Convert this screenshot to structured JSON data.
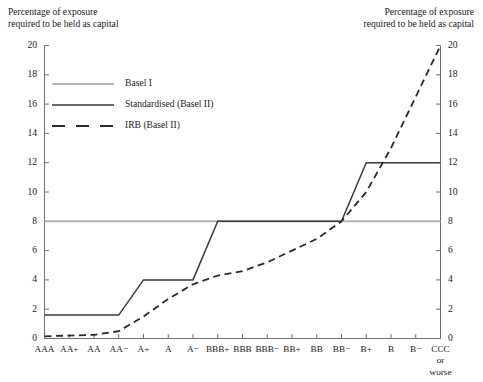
{
  "chart_data": {
    "type": "line",
    "title": "",
    "axis_title_left": "Percentage of exposure\nrequired to be held as capital",
    "axis_title_right": "Percentage of exposure\nrequired to be held as capital",
    "xlabel": "",
    "ylabel": "",
    "ylim": [
      0,
      20
    ],
    "yticks": [
      0,
      2,
      4,
      6,
      8,
      10,
      12,
      14,
      16,
      18,
      20
    ],
    "ytick_labels_left": [
      "0",
      "2",
      "4",
      "6",
      "8",
      "10",
      "12",
      "14",
      "16",
      "18",
      "20"
    ],
    "ytick_labels_right": [
      "0",
      "2",
      "4",
      "6",
      "8",
      "10",
      "12",
      "14",
      "16",
      "18",
      "20"
    ],
    "grid": false,
    "legend_position": "upper-left-inside",
    "categories": [
      "AAA",
      "AA+",
      "AA",
      "AA−",
      "A+",
      "A",
      "A−",
      "BBB+",
      "BBB",
      "BBB−",
      "BB+",
      "BB",
      "BB−",
      "B+",
      "B",
      "B−",
      "CCC\nor\nworse"
    ],
    "category_labels": [
      "AAA",
      "AA+",
      "AA",
      "AA−",
      "A+",
      "A",
      "A−",
      "BBB+",
      "BBB",
      "BBB−",
      "BB+",
      "BB",
      "BB−",
      "B+",
      "B",
      "B−",
      "CCC or worse"
    ],
    "series": [
      {
        "name": "Basel I",
        "style": "solid",
        "color": "#b6b6b6",
        "width": 2.0,
        "values": [
          8,
          8,
          8,
          8,
          8,
          8,
          8,
          8,
          8,
          8,
          8,
          8,
          8,
          8,
          8,
          8,
          8
        ]
      },
      {
        "name": "Standardised (Basel II)",
        "style": "solid",
        "color": "#3a3a3a",
        "width": 1.5,
        "values": [
          1.6,
          1.6,
          1.6,
          1.6,
          4,
          4,
          4,
          8,
          8,
          8,
          8,
          8,
          8,
          12,
          12,
          12,
          12
        ]
      },
      {
        "name": "IRB (Basel II)",
        "style": "dashed",
        "color": "#2a2a2a",
        "width": 1.8,
        "values": [
          0.15,
          0.2,
          0.25,
          0.5,
          1.5,
          2.7,
          3.7,
          4.3,
          4.6,
          5.2,
          6.0,
          6.8,
          8.0,
          10.0,
          13.0,
          16.5,
          20.0
        ]
      }
    ],
    "legend": [
      {
        "label": "Basel I",
        "style": "solid",
        "color": "#b6b6b6"
      },
      {
        "label": "Standardised (Basel II)",
        "style": "solid",
        "color": "#3a3a3a"
      },
      {
        "label": "IRB (Basel II)",
        "style": "dashed",
        "color": "#2a2a2a"
      }
    ]
  },
  "axis": {
    "color": "#6f6f6f"
  }
}
